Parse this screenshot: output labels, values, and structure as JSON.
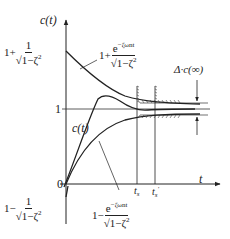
{
  "diagram": {
    "type": "second-order underdamped step response with envelope curves",
    "y_axis_label": "c(t)",
    "x_axis_label": "t",
    "origin_label": "0",
    "steady_value_label": "1",
    "upper_start_label": {
      "prefix": "1+",
      "numerator": "1",
      "denominator": "√1−ζ²"
    },
    "upper_envelope_label": {
      "prefix": "1+",
      "numerator": "e^{-ζω_n t}",
      "denominator": "√1−ζ²"
    },
    "lower_start_label": {
      "prefix": "1−",
      "numerator": "1",
      "denominator": "√1−ζ²"
    },
    "lower_envelope_label": {
      "prefix": "1−",
      "numerator": "e^{-ζω_n t}",
      "denominator": "√1−ζ²"
    },
    "response_label": "c(t)",
    "tolerance_label": "Δ·c(∞)",
    "settling_time_label": "t_s",
    "settling_time_prime_label": "t_s'"
  },
  "text": {
    "ct": "c(",
    "t": "t",
    "close": ")",
    "one": "1",
    "zero": "0",
    "plus_prefix": "1+",
    "minus_prefix": "1−",
    "num_one": "1",
    "num_exp_base": "e",
    "num_exp_power": "−ζω",
    "num_exp_sub": "n",
    "num_exp_t": "t",
    "sqrt_den": "√1−ζ",
    "den_sq": "2",
    "delta": "Δ·c(∞)",
    "ts": "t",
    "ts_sub": "s",
    "ts_prime": "'"
  }
}
